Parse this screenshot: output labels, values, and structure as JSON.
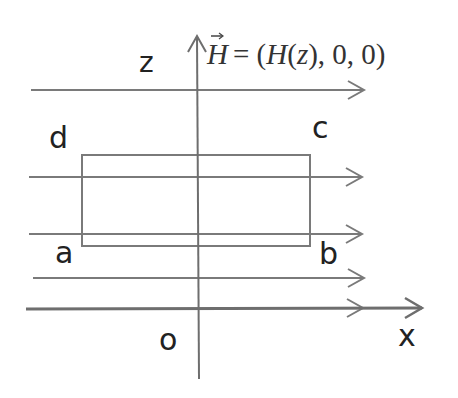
{
  "diagram": {
    "title_equation": {
      "vector": "H",
      "rhs": "= (H(z), 0, 0)",
      "full": "→H = (H(z),0,0)"
    },
    "axes": {
      "vertical_label": "z",
      "horizontal_label": "x",
      "origin_label": "o"
    },
    "loop_corners": {
      "a": "a",
      "b": "b",
      "c": "c",
      "d": "d"
    },
    "field_lines": [
      {
        "y": 90,
        "x_start": 31,
        "x_end": 364
      },
      {
        "y": 177,
        "x_start": 29,
        "x_end": 362
      },
      {
        "y": 234,
        "x_start": 29,
        "x_end": 362
      },
      {
        "y": 278,
        "x_start": 33,
        "x_end": 364
      },
      {
        "y": 308,
        "x_start": 27,
        "x_end": 363
      }
    ],
    "colors": {
      "line": "#7a7a7a",
      "axis": "#6e6e6e",
      "text": "#222222"
    }
  }
}
